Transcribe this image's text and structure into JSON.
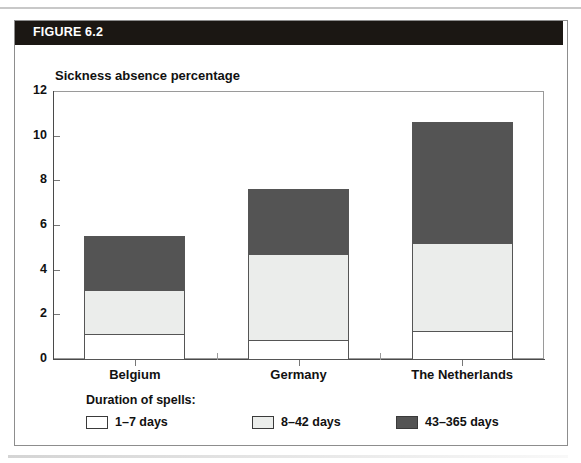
{
  "figure": {
    "header_label": "FIGURE 6.2"
  },
  "chart_data": {
    "type": "bar",
    "subtype": "stacked-vertical",
    "title": "Sickness absence percentage",
    "xlabel": "",
    "ylabel": "",
    "ylim": [
      0,
      12
    ],
    "yticks": [
      0,
      2,
      4,
      6,
      8,
      10,
      12
    ],
    "ytick_labels": [
      "0",
      "2",
      "4",
      "6",
      "8",
      "10",
      "12"
    ],
    "grid": false,
    "legend_position": "below-axes",
    "legend_title": "Duration of spells:",
    "categories": [
      "Belgium",
      "Germany",
      "The Netherlands"
    ],
    "series": [
      {
        "name": "1–7 days",
        "color": "#ffffff",
        "values": [
          1.1,
          0.85,
          1.25
        ]
      },
      {
        "name": "8–42 days",
        "color": "#ebedeb",
        "values": [
          2.0,
          3.85,
          3.95
        ]
      },
      {
        "name": "43–365 days",
        "color": "#545454",
        "values": [
          2.4,
          2.9,
          5.4
        ]
      }
    ],
    "totals": [
      5.5,
      7.6,
      10.6
    ]
  },
  "legend": {
    "title": "Duration of spells:",
    "entries": [
      {
        "label": "1–7 days",
        "color": "#ffffff"
      },
      {
        "label": "8–42 days",
        "color": "#ebedeb"
      },
      {
        "label": "43–365 days",
        "color": "#545454"
      }
    ]
  },
  "colors": {
    "header_bar": "#1b1713",
    "header_text": "#ffffff",
    "frame": "#8d8d8d",
    "axis": "#4a4a4a",
    "segment_border": "#555555"
  }
}
